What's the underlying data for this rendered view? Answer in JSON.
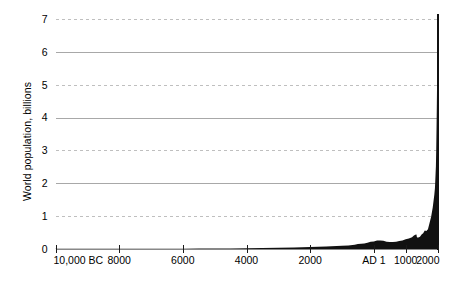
{
  "chart_data": {
    "type": "area",
    "title": "",
    "subtitle": "",
    "xlabel": "",
    "ylabel": "World population, billions",
    "xlim": [
      -10000,
      2000
    ],
    "ylim": [
      0,
      7
    ],
    "grid": true,
    "legend": null,
    "y_ticks": [
      0,
      1,
      2,
      3,
      4,
      5,
      6,
      7
    ],
    "y_tick_labels": [
      "0",
      "1",
      "2",
      "3",
      "4",
      "5",
      "6",
      "7"
    ],
    "y_gridline_styles": {
      "1": "dashed",
      "2": "solid",
      "3": "dashed",
      "4": "solid",
      "5": "dashed",
      "6": "solid",
      "7": "dashed"
    },
    "x_ticks": [
      -10000,
      -8000,
      -6000,
      -4000,
      -2000,
      1,
      1000,
      2000
    ],
    "x_tick_labels": [
      "10,000 BC",
      "8000",
      "6000",
      "4000",
      "2000",
      "AD 1",
      "1000",
      "2000"
    ],
    "series": [
      {
        "name": "World population",
        "color": "#111111",
        "x": [
          -10000,
          -9500,
          -9000,
          -8500,
          -8000,
          -7500,
          -7000,
          -6500,
          -6000,
          -5500,
          -5000,
          -4500,
          -4000,
          -3500,
          -3000,
          -2500,
          -2000,
          -1500,
          -1000,
          -800,
          -600,
          -500,
          -400,
          -300,
          -200,
          -100,
          1,
          100,
          200,
          300,
          400,
          500,
          600,
          700,
          800,
          900,
          1000,
          1100,
          1200,
          1250,
          1300,
          1340,
          1350,
          1360,
          1400,
          1450,
          1500,
          1550,
          1600,
          1650,
          1700,
          1750,
          1800,
          1850,
          1900,
          1920,
          1930,
          1940,
          1950,
          1960,
          1970,
          1980,
          1990,
          2000,
          2011
        ],
        "y": [
          0.004,
          0.004,
          0.005,
          0.005,
          0.005,
          0.006,
          0.007,
          0.008,
          0.01,
          0.012,
          0.015,
          0.018,
          0.022,
          0.028,
          0.035,
          0.045,
          0.06,
          0.075,
          0.1,
          0.11,
          0.13,
          0.15,
          0.16,
          0.17,
          0.19,
          0.22,
          0.23,
          0.26,
          0.26,
          0.25,
          0.22,
          0.21,
          0.21,
          0.22,
          0.24,
          0.26,
          0.3,
          0.32,
          0.36,
          0.4,
          0.43,
          0.44,
          0.37,
          0.35,
          0.35,
          0.37,
          0.44,
          0.48,
          0.56,
          0.55,
          0.6,
          0.79,
          0.98,
          1.26,
          1.65,
          1.86,
          2.07,
          2.3,
          2.52,
          3.02,
          3.7,
          4.44,
          5.31,
          6.12,
          7.0
        ],
        "y_unit": "billions"
      }
    ],
    "annotations": []
  },
  "axis": {
    "y_title": "World population, billions"
  }
}
